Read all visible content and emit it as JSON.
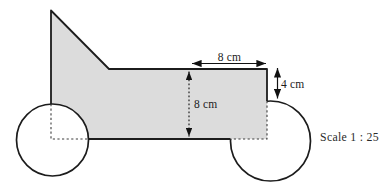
{
  "diagram": {
    "type": "scale-drawing-of-vehicle",
    "scale_label": "Scale 1 : 25",
    "labels": {
      "top_width": "8 cm",
      "cab_height": "4 cm",
      "body_height": "8 cm"
    },
    "colors": {
      "body_fill": "#dcdcdc",
      "wheel_fill": "#ffffff",
      "outline": "#1c1c1c",
      "hidden_edge": "#3d3d3d",
      "dimension_line": "#111111",
      "text": "#2a2a2a",
      "background": "#ffffff"
    }
  }
}
